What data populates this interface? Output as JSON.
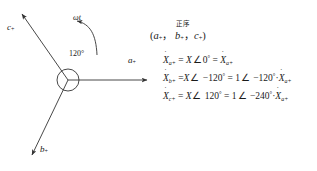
{
  "figure": {
    "type": "phasor-diagram",
    "stroke_color": "#333333",
    "text_color": "#1a1a1a",
    "background": "#ffffff"
  },
  "diagram": {
    "center": {
      "x": 68,
      "y": 80,
      "radius": 11
    },
    "angle_label": "120°",
    "rotation_label": "ωt",
    "rotation_direction": "counterclockwise",
    "vectors": [
      {
        "name": "a-phase",
        "label_base": "a",
        "label_sub": "+",
        "angle_deg": 0,
        "label_x": 131,
        "label_y": 62
      },
      {
        "name": "b-phase",
        "label_base": "b",
        "label_sub": "+",
        "angle_deg": -120,
        "label_x": 44,
        "label_y": 152
      },
      {
        "name": "c-phase",
        "label_base": "c",
        "label_sub": "+",
        "angle_deg": 120,
        "label_x": 8,
        "label_y": 28
      }
    ]
  },
  "sequence": {
    "cn_caption": "正序",
    "label_open": "(",
    "label_items": [
      "a",
      "b",
      "c"
    ],
    "label_sub": "+",
    "label_close": ")",
    "label_sep": "，"
  },
  "equations": [
    {
      "name": "equation-a",
      "lhs_base": "X",
      "lhs_sub": "a+",
      "parts": [
        {
          "t": "=",
          "k": "op"
        },
        {
          "t": "X",
          "k": "var"
        },
        {
          "t": "∠",
          "k": "ang"
        },
        {
          "t": "0",
          "k": "num"
        },
        {
          "t": "°",
          "k": "deg"
        },
        {
          "t": "=",
          "k": "op"
        }
      ],
      "tail_base": "X",
      "tail_sub": "a+"
    },
    {
      "name": "equation-b",
      "lhs_base": "X",
      "lhs_sub": "b+",
      "parts": [
        {
          "t": "=",
          "k": "op"
        },
        {
          "t": "X",
          "k": "var"
        },
        {
          "t": "∠",
          "k": "ang"
        },
        {
          "t": "−120",
          "k": "num"
        },
        {
          "t": "°",
          "k": "deg"
        },
        {
          "t": "=",
          "k": "op"
        },
        {
          "t": "1",
          "k": "num"
        },
        {
          "t": "∠",
          "k": "ang"
        },
        {
          "t": "−120",
          "k": "num"
        },
        {
          "t": "°",
          "k": "deg"
        },
        {
          "t": "·",
          "k": "op"
        }
      ],
      "tail_base": "X",
      "tail_sub": "a+"
    },
    {
      "name": "equation-c",
      "lhs_base": "X",
      "lhs_sub": "c+",
      "parts": [
        {
          "t": "=",
          "k": "op"
        },
        {
          "t": "X",
          "k": "var"
        },
        {
          "t": "∠",
          "k": "ang"
        },
        {
          "t": "120",
          "k": "num"
        },
        {
          "t": "°",
          "k": "deg"
        },
        {
          "t": "=",
          "k": "op"
        },
        {
          "t": "1",
          "k": "num"
        },
        {
          "t": "∠",
          "k": "ang"
        },
        {
          "t": "−240",
          "k": "num"
        },
        {
          "t": "°",
          "k": "deg"
        },
        {
          "t": "·",
          "k": "op"
        }
      ],
      "tail_base": "X",
      "tail_sub": "a+"
    }
  ]
}
